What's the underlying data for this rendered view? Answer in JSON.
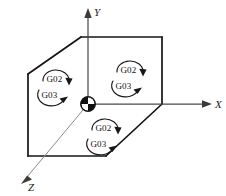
{
  "figure": {
    "name": "circular-interpolation-plane-diagram",
    "background_color": "#ffffff",
    "line_color": "#141414",
    "axis_color": "#4a4a4a"
  },
  "axes": [
    {
      "id": "x",
      "label": "X",
      "direction": "right"
    },
    {
      "id": "y",
      "label": "Y",
      "direction": "up"
    },
    {
      "id": "z",
      "label": "Z",
      "direction": "down-left"
    }
  ],
  "origin": {
    "marker": "origin-sphere-marker",
    "description": "quadrant shaded sphere"
  },
  "planes": [
    {
      "id": "yz-plane",
      "position": "left",
      "arcs": [
        {
          "code": "G02",
          "direction": "clockwise"
        },
        {
          "code": "G03",
          "direction": "counterclockwise"
        }
      ]
    },
    {
      "id": "xy-plane",
      "position": "right",
      "arcs": [
        {
          "code": "G02",
          "direction": "clockwise"
        },
        {
          "code": "G03",
          "direction": "counterclockwise"
        }
      ]
    },
    {
      "id": "zx-plane",
      "position": "bottom",
      "arcs": [
        {
          "code": "G02",
          "direction": "clockwise"
        },
        {
          "code": "G03",
          "direction": "counterclockwise"
        }
      ]
    }
  ]
}
